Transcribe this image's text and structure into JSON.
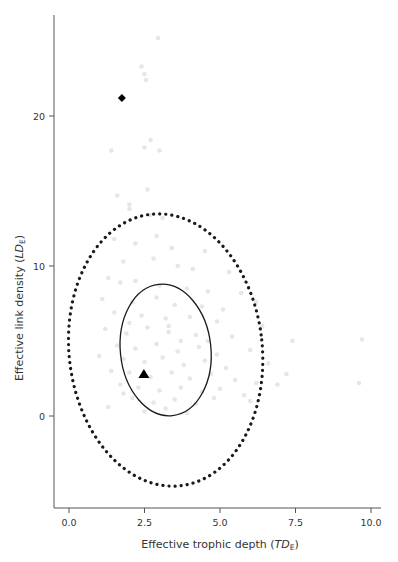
{
  "chart_data": {
    "type": "scatter",
    "title": "",
    "xlabel": "Effective trophic depth (TD_E)",
    "xlabel_main": "Effective trophic depth (",
    "xlabel_italic": "TD",
    "xlabel_sub": "E",
    "xlabel_close": ")",
    "ylabel": "Effective link density (LD_E)",
    "ylabel_main": "Effective link density (",
    "ylabel_italic": "LD",
    "ylabel_sub": "E",
    "ylabel_close": ")",
    "xlim": [
      -0.5,
      10.3
    ],
    "ylim": [
      -6,
      26.7
    ],
    "x_ticks": [
      0.0,
      2.5,
      5.0,
      7.5,
      10.0
    ],
    "x_tick_labels": [
      "0.0",
      "2.5",
      "5.0",
      "7.5",
      "10.0"
    ],
    "y_ticks": [
      0,
      10,
      20
    ],
    "y_tick_labels": [
      "0",
      "10",
      "20"
    ],
    "grid": false,
    "legend": null,
    "colors": {
      "background_points": "#e6e6e6",
      "markers": "#000000",
      "ellipse": "#1a1a1a",
      "axis": "#555555",
      "text": "#333333"
    },
    "series": [
      {
        "name": "food webs (background cloud)",
        "style": "light-gray-dots",
        "points": [
          [
            2.95,
            25.2
          ],
          [
            2.4,
            23.3
          ],
          [
            2.5,
            22.8
          ],
          [
            2.55,
            22.4
          ],
          [
            1.4,
            17.7
          ],
          [
            2.7,
            18.4
          ],
          [
            2.5,
            17.9
          ],
          [
            3.0,
            17.7
          ],
          [
            1.6,
            14.7
          ],
          [
            2.6,
            15.1
          ],
          [
            2.0,
            14.1
          ],
          [
            2.0,
            13.8
          ],
          [
            2.7,
            13.4
          ],
          [
            3.1,
            13.2
          ],
          [
            2.9,
            12.0
          ],
          [
            1.5,
            11.8
          ],
          [
            2.2,
            11.5
          ],
          [
            3.4,
            11.2
          ],
          [
            4.5,
            11.0
          ],
          [
            1.8,
            10.3
          ],
          [
            2.8,
            10.5
          ],
          [
            3.6,
            10.0
          ],
          [
            4.1,
            9.8
          ],
          [
            5.3,
            9.6
          ],
          [
            1.3,
            9.2
          ],
          [
            1.7,
            8.9
          ],
          [
            2.2,
            9.0
          ],
          [
            3.0,
            8.7
          ],
          [
            3.9,
            8.5
          ],
          [
            4.6,
            8.3
          ],
          [
            5.7,
            8.2
          ],
          [
            1.1,
            7.8
          ],
          [
            2.1,
            7.6
          ],
          [
            2.9,
            7.9
          ],
          [
            3.5,
            7.4
          ],
          [
            4.4,
            7.3
          ],
          [
            5.1,
            7.1
          ],
          [
            6.2,
            7.6
          ],
          [
            1.5,
            6.9
          ],
          [
            2.4,
            6.7
          ],
          [
            3.2,
            6.5
          ],
          [
            4.0,
            6.6
          ],
          [
            4.9,
            6.3
          ],
          [
            6.4,
            6.0
          ],
          [
            9.7,
            5.1
          ],
          [
            1.2,
            5.8
          ],
          [
            1.9,
            5.5
          ],
          [
            2.6,
            5.9
          ],
          [
            3.3,
            5.6
          ],
          [
            4.2,
            5.4
          ],
          [
            5.4,
            5.3
          ],
          [
            7.4,
            5.0
          ],
          [
            1.6,
            4.7
          ],
          [
            2.2,
            4.5
          ],
          [
            2.9,
            4.8
          ],
          [
            3.6,
            4.3
          ],
          [
            4.3,
            4.6
          ],
          [
            4.9,
            4.1
          ],
          [
            6.0,
            4.4
          ],
          [
            1.0,
            4.0
          ],
          [
            1.8,
            3.8
          ],
          [
            2.5,
            3.6
          ],
          [
            3.1,
            3.9
          ],
          [
            3.8,
            3.4
          ],
          [
            4.5,
            3.7
          ],
          [
            5.2,
            3.2
          ],
          [
            6.6,
            3.5
          ],
          [
            7.2,
            2.8
          ],
          [
            1.4,
            3.0
          ],
          [
            2.0,
            2.9
          ],
          [
            2.7,
            2.6
          ],
          [
            3.4,
            2.9
          ],
          [
            4.0,
            2.5
          ],
          [
            4.7,
            2.8
          ],
          [
            5.5,
            2.4
          ],
          [
            6.2,
            2.2
          ],
          [
            6.9,
            2.1
          ],
          [
            9.6,
            2.2
          ],
          [
            1.7,
            2.1
          ],
          [
            2.3,
            1.9
          ],
          [
            3.0,
            1.7
          ],
          [
            3.7,
            1.9
          ],
          [
            4.4,
            1.6
          ],
          [
            5.0,
            1.8
          ],
          [
            5.8,
            1.4
          ],
          [
            2.1,
            1.2
          ],
          [
            2.8,
            0.9
          ],
          [
            3.5,
            1.1
          ],
          [
            4.2,
            0.8
          ],
          [
            4.8,
            1.2
          ],
          [
            6.0,
            1.0
          ],
          [
            2.5,
            0.3
          ],
          [
            3.2,
            0.5
          ],
          [
            3.9,
            0.2
          ],
          [
            1.3,
            0.6
          ],
          [
            1.8,
            1.5
          ],
          [
            3.3,
            6.0
          ],
          [
            2.0,
            6.2
          ],
          [
            3.7,
            5.0
          ],
          [
            4.6,
            5.0
          ]
        ]
      },
      {
        "name": "highlighted web (diamond)",
        "marker": "diamond",
        "points": [
          [
            1.75,
            21.2
          ]
        ]
      },
      {
        "name": "highlighted web (triangle)",
        "marker": "triangle",
        "points": [
          [
            2.48,
            2.8
          ]
        ]
      }
    ],
    "ellipses": [
      {
        "name": "outer confidence ellipse",
        "style": "dotted",
        "center": [
          3.2,
          4.4
        ],
        "semi_axis_x": 3.2,
        "semi_axis_y": 9.1,
        "tilt_deg": -6
      },
      {
        "name": "inner confidence ellipse",
        "style": "solid",
        "center": [
          3.2,
          4.4
        ],
        "semi_axis_x": 1.5,
        "semi_axis_y": 4.4,
        "tilt_deg": -6
      }
    ]
  }
}
